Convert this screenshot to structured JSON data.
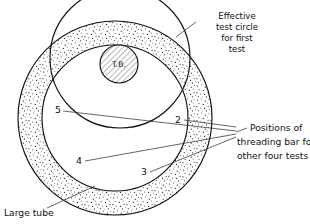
{
  "figure": {
    "background_color": "#ffffff",
    "ink_color": "#111111",
    "stipple_color": "#3a3a3a"
  },
  "annotations": {
    "effective_test_circle": {
      "lines": [
        "Effective",
        "test circle",
        "for first",
        "test"
      ],
      "line1": "Effective",
      "line2": "test circle",
      "line3": "for first",
      "line4": "test"
    },
    "threading_bar_positions": {
      "lines": [
        "Positions of",
        "threading bar for",
        "other four tests"
      ],
      "line1": "Positions of",
      "line2": "threading bar for",
      "line3": "other four tests"
    },
    "large_tube": {
      "label": "Large tube"
    },
    "threading_bar": {
      "label": "T.B."
    }
  },
  "position_markers": [
    {
      "id": "marker-2",
      "label": "2"
    },
    {
      "id": "marker-3",
      "label": "3"
    },
    {
      "id": "marker-4",
      "label": "4"
    },
    {
      "id": "marker-5",
      "label": "5"
    }
  ],
  "marker_labels": {
    "two": "2",
    "three": "3",
    "four": "4",
    "five": "5"
  }
}
